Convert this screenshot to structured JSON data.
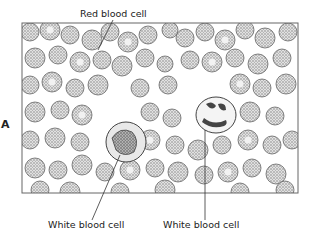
{
  "figure": {
    "panel_letter": "A",
    "labels": {
      "top": "Red blood cell",
      "bottom_left": "White blood cell",
      "bottom_right": "White blood cell"
    },
    "colors": {
      "cell_stroke": "#555555",
      "cell_fill": "#cfcfcf",
      "frame": "#666666",
      "nucleus": "#444444"
    }
  }
}
